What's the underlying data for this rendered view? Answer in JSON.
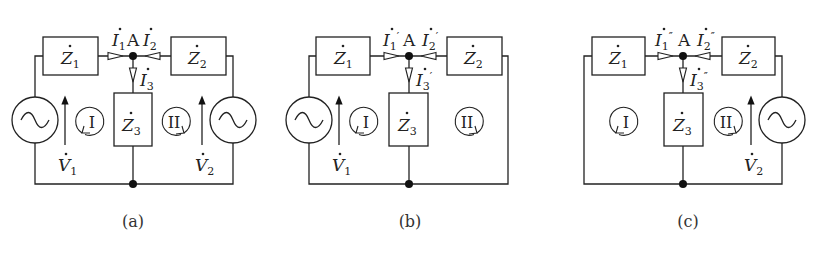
{
  "figure": {
    "panels": [
      {
        "id": "a",
        "caption": "(a)",
        "node_label": "A",
        "impedances": [
          "Z",
          "Z",
          "Z"
        ],
        "impedance_subs": [
          "1",
          "2",
          "3"
        ],
        "currents": [
          {
            "sym": "I",
            "sub": "1",
            "prime": ""
          },
          {
            "sym": "I",
            "sub": "2",
            "prime": ""
          },
          {
            "sym": "I",
            "sub": "3",
            "prime": ""
          }
        ],
        "sources": [
          {
            "sym": "V",
            "sub": "1",
            "side": "left"
          },
          {
            "sym": "V",
            "sub": "2",
            "side": "right"
          }
        ],
        "loops": [
          "I",
          "II"
        ]
      },
      {
        "id": "b",
        "caption": "(b)",
        "node_label": "A",
        "impedances": [
          "Z",
          "Z",
          "Z"
        ],
        "impedance_subs": [
          "1",
          "2",
          "3"
        ],
        "currents": [
          {
            "sym": "I",
            "sub": "1",
            "prime": "′"
          },
          {
            "sym": "I",
            "sub": "2",
            "prime": "′"
          },
          {
            "sym": "I",
            "sub": "3",
            "prime": "′"
          }
        ],
        "sources": [
          {
            "sym": "V",
            "sub": "1",
            "side": "left"
          }
        ],
        "loops": [
          "I",
          "II"
        ]
      },
      {
        "id": "c",
        "caption": "(c)",
        "node_label": "A",
        "impedances": [
          "Z",
          "Z",
          "Z"
        ],
        "impedance_subs": [
          "1",
          "2",
          "3"
        ],
        "currents": [
          {
            "sym": "I",
            "sub": "1",
            "prime": "″"
          },
          {
            "sym": "I",
            "sub": "2",
            "prime": "″"
          },
          {
            "sym": "I",
            "sub": "3",
            "prime": "″"
          }
        ],
        "sources": [
          {
            "sym": "V",
            "sub": "2",
            "side": "right"
          }
        ],
        "loops": [
          "I",
          "II"
        ]
      }
    ]
  }
}
